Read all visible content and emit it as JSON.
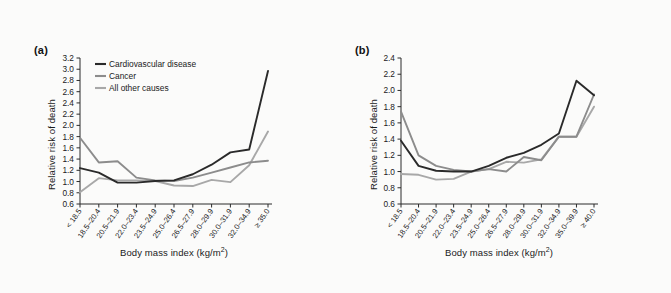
{
  "figure": {
    "background_color": "#fbfbfa",
    "panels": [
      {
        "id": "a",
        "panel_label": "(a)",
        "ylabel": "Relative risk of death",
        "xlabel_main": "Body mass index (kg/m",
        "xlabel_sup": "2",
        "xlabel_tail": ")"
      },
      {
        "id": "b",
        "panel_label": "(b)",
        "ylabel": "Relative risk of death",
        "xlabel_main": "Body mass index (kg/m",
        "xlabel_sup": "2",
        "xlabel_tail": ")"
      }
    ],
    "legend": {
      "items": [
        {
          "label": "Cardiovascular disease",
          "color": "#2a2a2a"
        },
        {
          "label": "Cancer",
          "color": "#8c8c8c"
        },
        {
          "label": "All other causes",
          "color": "#a8a8a8"
        }
      ]
    }
  },
  "chart_data": [
    {
      "type": "line",
      "panel": "a",
      "title": "(a)",
      "xlabel": "Body mass index (kg/m2)",
      "ylabel": "Relative risk of death",
      "ylim": [
        0.6,
        3.2
      ],
      "yticks": [
        "3.2",
        "3.0",
        "2.8",
        "2.6",
        "2.4",
        "2.2",
        "2.0",
        "1.8",
        "1.6",
        "1.4",
        "1.2",
        "1.0",
        "0.8",
        "0.6"
      ],
      "ytick_values": [
        3.2,
        3.0,
        2.8,
        2.6,
        2.4,
        2.2,
        2.0,
        1.8,
        1.6,
        1.4,
        1.2,
        1.0,
        0.8,
        0.6
      ],
      "grid": false,
      "legend_position": "top-left",
      "categories": [
        "< 18.5",
        "18.5–20.4",
        "20.5–21.9",
        "22.0–23.4",
        "23.5–24.9",
        "25.0–26.4",
        "26.5–27.9",
        "28.0–29.9",
        "30.0–31.9",
        "32.0–34.9",
        "≥ 35.0"
      ],
      "series": [
        {
          "name": "Cardiovascular disease",
          "color": "#2a2a2a",
          "values": [
            1.24,
            1.16,
            0.98,
            0.98,
            1.01,
            1.02,
            1.13,
            1.3,
            1.52,
            1.57,
            2.97
          ]
        },
        {
          "name": "Cancer",
          "color": "#8c8c8c",
          "values": [
            1.78,
            1.34,
            1.36,
            1.07,
            1.02,
            1.01,
            1.07,
            1.16,
            1.25,
            1.34,
            1.37
          ]
        },
        {
          "name": "All other causes",
          "color": "#a8a8a8",
          "values": [
            0.81,
            1.06,
            1.02,
            1.02,
            1.01,
            0.93,
            0.92,
            1.03,
            0.99,
            1.29,
            1.89
          ]
        }
      ]
    },
    {
      "type": "line",
      "panel": "b",
      "title": "(b)",
      "xlabel": "Body mass index (kg/m2)",
      "ylabel": "Relative risk of death",
      "ylim": [
        0.6,
        2.4
      ],
      "yticks": [
        "2.4",
        "2.2",
        "2.0",
        "1.8",
        "1.6",
        "1.4",
        "1.2",
        "1.0",
        "0.8",
        "0.6"
      ],
      "ytick_values": [
        2.4,
        2.2,
        2.0,
        1.8,
        1.6,
        1.4,
        1.2,
        1.0,
        0.8,
        0.6
      ],
      "grid": false,
      "legend_position": "none",
      "categories": [
        "< 18.5",
        "18.5–20.4",
        "20.5–21.9",
        "22.0–23.4",
        "23.5–24.9",
        "25.0–26.4",
        "26.5–27.9",
        "28.0–29.9",
        "30.0–31.9",
        "32.0–34.9",
        "35.0–39.9",
        "≥ 40.0"
      ],
      "series": [
        {
          "name": "Cardiovascular disease",
          "color": "#2a2a2a",
          "values": [
            1.38,
            1.07,
            1.01,
            1.0,
            1.0,
            1.07,
            1.17,
            1.23,
            1.33,
            1.47,
            2.12,
            1.94
          ]
        },
        {
          "name": "Cancer",
          "color": "#8c8c8c",
          "values": [
            1.74,
            1.2,
            1.07,
            1.02,
            1.0,
            1.03,
            1.0,
            1.18,
            1.14,
            1.43,
            1.43,
            1.95
          ]
        },
        {
          "name": "All other causes",
          "color": "#a8a8a8",
          "values": [
            0.97,
            0.96,
            0.9,
            0.91,
            1.0,
            1.03,
            1.12,
            1.11,
            1.15,
            1.43,
            1.43,
            1.8
          ]
        }
      ]
    }
  ]
}
